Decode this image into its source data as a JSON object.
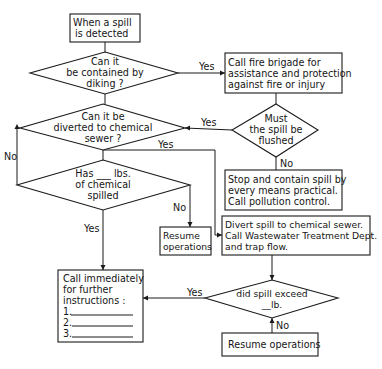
{
  "diagram": {
    "type": "flowchart",
    "nodes": {
      "start": {
        "shape": "box",
        "lines": [
          "When a spill",
          "is detected"
        ]
      },
      "q_diking": {
        "shape": "diamond",
        "lines": [
          "Can it",
          "be contained by",
          "diking ?"
        ]
      },
      "fire_brigade": {
        "shape": "box",
        "lines": [
          "Call fire brigade for",
          "assistance and protection",
          "against fire or injury"
        ]
      },
      "q_flushed": {
        "shape": "diamond",
        "lines": [
          "Must",
          "the spill be",
          "flushed"
        ]
      },
      "q_divert": {
        "shape": "diamond",
        "lines": [
          "Can it be",
          "diverted to chemical",
          "sewer ?"
        ]
      },
      "q_lbs": {
        "shape": "diamond",
        "lines": [
          "Has ___ lbs.",
          "of chemical",
          "spilled"
        ]
      },
      "stop_contain": {
        "shape": "box",
        "lines": [
          "Stop and contain spill by",
          "every means practical.",
          "Call pollution control."
        ]
      },
      "resume_1": {
        "shape": "box",
        "lines": [
          "Resume",
          "operations"
        ]
      },
      "divert_sewer": {
        "shape": "box",
        "lines": [
          "Divert spill to chemical sewer.",
          "Call Wastewater Treatment Dept.",
          "and trap flow."
        ]
      },
      "call_immediately": {
        "shape": "box",
        "lines": [
          "Call immediately",
          "for further",
          "instructions :",
          "1.",
          "2.",
          "3."
        ]
      },
      "q_exceed": {
        "shape": "diamond",
        "lines": [
          "did spill exceed",
          "__lb."
        ]
      },
      "resume_2": {
        "shape": "box",
        "lines": [
          "Resume operations"
        ]
      }
    },
    "edge_labels": {
      "diking_yes": "Yes",
      "flushed_yes": "Yes",
      "flushed_no": "No",
      "divert_yes": "Yes",
      "divert_no": "No",
      "lbs_no": "No",
      "lbs_yes": "Yes",
      "exceed_yes": "Yes",
      "exceed_no": "No"
    },
    "edges": [
      {
        "from": "start",
        "to": "q_diking",
        "label": ""
      },
      {
        "from": "q_diking",
        "to": "fire_brigade",
        "label": "Yes"
      },
      {
        "from": "q_diking",
        "to": "q_divert",
        "label": ""
      },
      {
        "from": "fire_brigade",
        "to": "q_flushed",
        "label": ""
      },
      {
        "from": "q_flushed",
        "to": "q_divert",
        "label": "Yes"
      },
      {
        "from": "q_flushed",
        "to": "stop_contain",
        "label": "No"
      },
      {
        "from": "q_divert",
        "to": "divert_sewer",
        "label": "Yes"
      },
      {
        "from": "q_divert",
        "to": "q_lbs",
        "label": "No"
      },
      {
        "from": "q_lbs",
        "to": "resume_1",
        "label": "No"
      },
      {
        "from": "q_lbs",
        "to": "call_immediately",
        "label": "Yes"
      },
      {
        "from": "divert_sewer",
        "to": "q_exceed",
        "label": ""
      },
      {
        "from": "q_exceed",
        "to": "call_immediately",
        "label": "Yes"
      },
      {
        "from": "q_exceed",
        "to": "resume_2",
        "label": "No"
      }
    ]
  }
}
